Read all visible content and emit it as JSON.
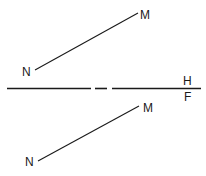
{
  "diagram": {
    "title": "",
    "views": {
      "top": {
        "label_start": "N",
        "label_end": "M"
      },
      "front": {
        "label_start": "N",
        "label_end": "M"
      }
    },
    "folding_line": {
      "label_above": "H",
      "label_below": "F"
    },
    "line_color": "#1a1a1a",
    "background": "#ffffff"
  }
}
